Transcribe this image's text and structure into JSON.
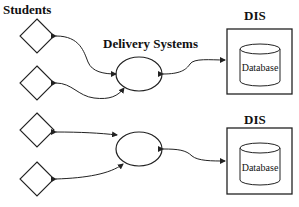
{
  "labels": {
    "students": "Students",
    "delivery_systems": "Delivery Systems",
    "dis_top": "DIS",
    "dis_bottom": "DIS",
    "database_top": "Database",
    "database_bottom": "Database"
  },
  "nodes": {
    "students": [
      {
        "id": "student-1",
        "shape": "diamond",
        "group": "top"
      },
      {
        "id": "student-2",
        "shape": "diamond",
        "group": "top"
      },
      {
        "id": "student-3",
        "shape": "diamond",
        "group": "bottom"
      },
      {
        "id": "student-4",
        "shape": "diamond",
        "group": "bottom"
      }
    ],
    "delivery_systems": [
      {
        "id": "delivery-system-1",
        "shape": "ellipse",
        "group": "top"
      },
      {
        "id": "delivery-system-2",
        "shape": "ellipse",
        "group": "bottom"
      }
    ],
    "dis": [
      {
        "id": "dis-1",
        "shape": "box-with-cylinder",
        "group": "top"
      },
      {
        "id": "dis-2",
        "shape": "box-with-cylinder",
        "group": "bottom"
      }
    ]
  },
  "edges": [
    {
      "from": "student-1",
      "to": "delivery-system-1",
      "style": "bidirectional-curved"
    },
    {
      "from": "student-2",
      "to": "delivery-system-1",
      "style": "bidirectional-curved"
    },
    {
      "from": "delivery-system-1",
      "to": "dis-1",
      "style": "bidirectional-curved"
    },
    {
      "from": "student-3",
      "to": "delivery-system-2",
      "style": "bidirectional-curved"
    },
    {
      "from": "student-4",
      "to": "delivery-system-2",
      "style": "bidirectional-curved"
    },
    {
      "from": "delivery-system-2",
      "to": "dis-2",
      "style": "bidirectional-curved"
    }
  ],
  "colors": {
    "stroke": "#222222",
    "background": "#ffffff"
  }
}
